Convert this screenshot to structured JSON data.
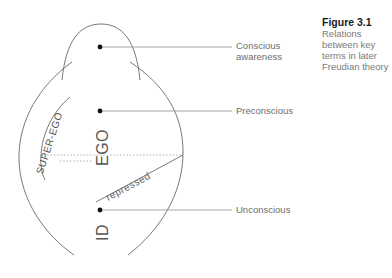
{
  "caption": {
    "figure_number": "Figure 3.1",
    "text": "Relations between key terms in later Freudian theory"
  },
  "levels": [
    {
      "label_line1": "Conscious",
      "label_line2": "awareness"
    },
    {
      "label_line1": "Preconscious"
    },
    {
      "label_line1": "Unconscious"
    }
  ],
  "regions": {
    "super_ego": "SUPER-EGO",
    "ego": "EGO",
    "id": "ID",
    "repressed": "repressed"
  },
  "colors": {
    "line": "#6a6a6a",
    "leader": "#9a9a9a",
    "dot": "#111111",
    "caption_title": "#1a1a1a",
    "caption_text": "#7a7a7a"
  }
}
